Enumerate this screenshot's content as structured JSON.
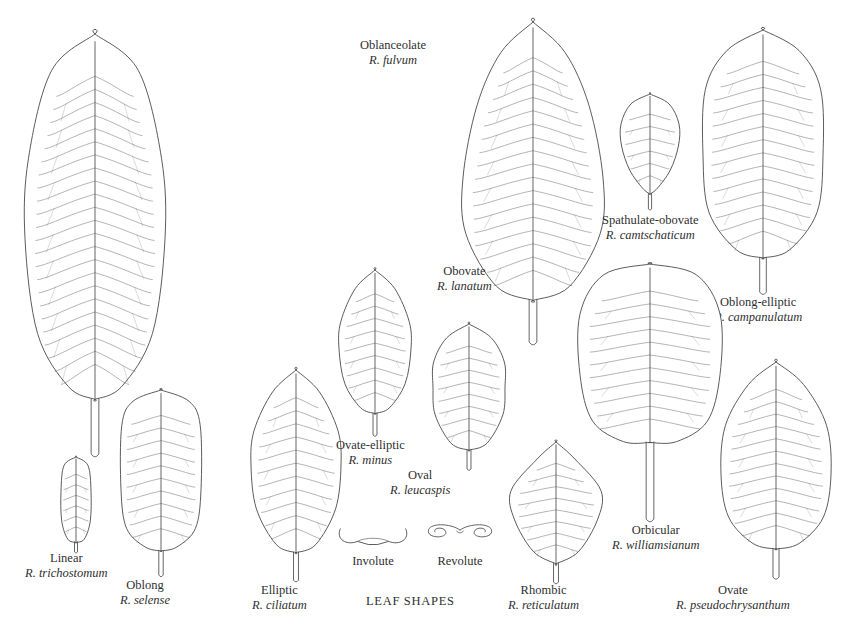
{
  "plate": {
    "title": "LEAF SHAPES",
    "background_color": "#ffffff",
    "ink_color": "#4a4a4a",
    "text_color": "#2f2f2f"
  },
  "leaves": [
    {
      "id": "oblanceolate",
      "common": "Oblanceolate",
      "scientific": "R. fulvum",
      "shape": "oblanceolate",
      "label_x": 360,
      "label_y": 38,
      "leaf_x": 22,
      "leaf_y": 32,
      "leaf_w": 140,
      "leaf_h": 420
    },
    {
      "id": "linear",
      "common": "Linear",
      "scientific": "R. trichostomum",
      "shape": "linear",
      "label_x": 25,
      "label_y": 551,
      "leaf_x": 58,
      "leaf_y": 455,
      "leaf_w": 30,
      "leaf_h": 95
    },
    {
      "id": "oblong",
      "common": "Oblong",
      "scientific": "R. selense",
      "shape": "oblong",
      "label_x": 120,
      "label_y": 578,
      "leaf_x": 118,
      "leaf_y": 388,
      "leaf_w": 80,
      "leaf_h": 185
    },
    {
      "id": "elliptic",
      "common": "Elliptic",
      "scientific": "R. ciliatum",
      "shape": "elliptic",
      "label_x": 252,
      "label_y": 583,
      "leaf_x": 248,
      "leaf_y": 368,
      "leaf_w": 90,
      "leaf_h": 210
    },
    {
      "id": "ovate-elliptic",
      "common": "Ovate-elliptic",
      "scientific": "R. minus",
      "shape": "ovate-elliptic",
      "label_x": 336,
      "label_y": 438,
      "leaf_x": 336,
      "leaf_y": 268,
      "leaf_w": 72,
      "leaf_h": 165
    },
    {
      "id": "oval",
      "common": "Oval",
      "scientific": "R. leucaspis",
      "shape": "oval",
      "label_x": 390,
      "label_y": 468,
      "leaf_x": 430,
      "leaf_y": 322,
      "leaf_w": 72,
      "leaf_h": 145
    },
    {
      "id": "obovate",
      "common": "Obovate",
      "scientific": "R. lanatum",
      "shape": "obovate",
      "label_x": 437,
      "label_y": 264,
      "leaf_x": 460,
      "leaf_y": 20,
      "leaf_w": 140,
      "leaf_h": 320
    },
    {
      "id": "spathulate-obovate",
      "common": "Spathulate-obovate",
      "scientific": "R. camtschaticum",
      "shape": "spathulate-obovate",
      "label_x": 602,
      "label_y": 213,
      "leaf_x": 618,
      "leaf_y": 92,
      "leaf_w": 58,
      "leaf_h": 115
    },
    {
      "id": "oblong-elliptic",
      "common": "Oblong-elliptic",
      "scientific": "R. campanulatum",
      "shape": "oblong-elliptic",
      "label_x": 714,
      "label_y": 295,
      "leaf_x": 700,
      "leaf_y": 28,
      "leaf_w": 120,
      "leaf_h": 262
    },
    {
      "id": "orbicular",
      "common": "Orbicular",
      "scientific": "R. williamsianum",
      "shape": "orbicular",
      "label_x": 612,
      "label_y": 523,
      "leaf_x": 577,
      "leaf_y": 262,
      "leaf_w": 140,
      "leaf_h": 255
    },
    {
      "id": "rhombic",
      "common": "Rhombic",
      "scientific": "R. reticulatum",
      "shape": "rhombic",
      "label_x": 508,
      "label_y": 583,
      "leaf_x": 508,
      "leaf_y": 440,
      "leaf_w": 90,
      "leaf_h": 140
    },
    {
      "id": "ovate",
      "common": "Ovate",
      "scientific": "R. pseudochrysanthum",
      "shape": "ovate",
      "label_x": 676,
      "label_y": 583,
      "leaf_x": 718,
      "leaf_y": 360,
      "leaf_w": 110,
      "leaf_h": 215
    }
  ],
  "cross_sections": [
    {
      "id": "involute",
      "label": "Involute",
      "label_x": 334,
      "label_y": 554,
      "dia_x": 334,
      "dia_y": 525,
      "dia_w": 78,
      "dia_h": 26
    },
    {
      "id": "revolute",
      "label": "Revolute",
      "label_x": 424,
      "label_y": 554,
      "dia_x": 424,
      "dia_y": 521,
      "dia_w": 72,
      "dia_h": 30
    }
  ],
  "title_pos": {
    "x": 366,
    "y": 594
  }
}
